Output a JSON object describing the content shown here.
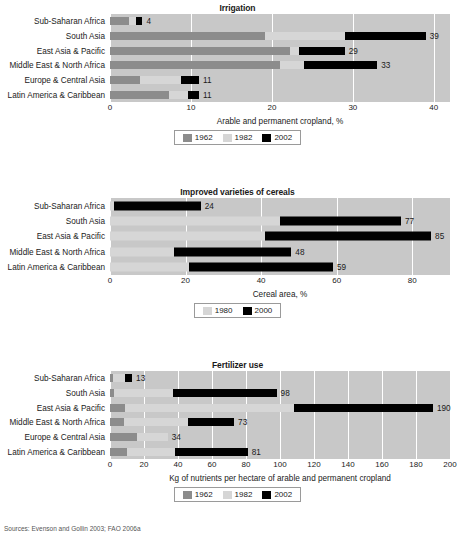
{
  "figure": {
    "source_note": "Sources: Evenson and Gollin 2003; FAO 2006a"
  },
  "colors": {
    "c1962": "#8c8c8c",
    "c1982": "#d6d6d6",
    "c2002": "#000000",
    "c1980": "#d6d6d6",
    "c2000": "#000000",
    "plot_background": "#c8c8c8",
    "gridline": "#ffffff"
  },
  "chart_data": [
    {
      "type": "bar",
      "orientation": "horizontal",
      "title": "Irrigation",
      "xlabel": "Arable and permanent cropland, %",
      "ylabel": "",
      "xlim": [
        0,
        42
      ],
      "xticks": [
        0,
        10,
        20,
        30,
        40
      ],
      "xticklabels": [
        "0",
        "10",
        "20",
        "30",
        "40"
      ],
      "grid": true,
      "legend_position": "bottom",
      "categories": [
        "Sub-Saharan Africa",
        "South Asia",
        "East Asia & Pacific",
        "Middle East & North Africa",
        "Europe & Central Asia",
        "Latin America & Caribbean"
      ],
      "series": [
        {
          "name": "1962",
          "values": [
            2.3,
            19.2,
            22.2,
            21.0,
            3.7,
            7.3
          ]
        },
        {
          "name": "1982",
          "values": [
            3.2,
            29.0,
            23.3,
            24.0,
            8.8,
            9.6
          ]
        },
        {
          "name": "2002",
          "values": [
            4,
            39,
            29,
            33,
            11,
            11
          ]
        }
      ],
      "data_labels": [
        "4",
        "39",
        "29",
        "33",
        "11",
        "11"
      ]
    },
    {
      "type": "bar",
      "orientation": "horizontal",
      "title": "Improved varieties of cereals",
      "xlabel": "Cereal area, %",
      "ylabel": "",
      "xlim": [
        0,
        90
      ],
      "xticks": [
        0,
        20,
        40,
        60,
        80
      ],
      "xticklabels": [
        "0",
        "20",
        "40",
        "60",
        "80"
      ],
      "grid": true,
      "legend_position": "bottom",
      "categories": [
        "Sub-Saharan Africa",
        "South Asia",
        "East Asia & Pacific",
        "Middle East & North Africa",
        "Latin America & Caribbean"
      ],
      "series": [
        {
          "name": "1980",
          "values": [
            1,
            45,
            41,
            17,
            21
          ]
        },
        {
          "name": "2000",
          "values": [
            24,
            77,
            85,
            48,
            59
          ]
        }
      ],
      "data_labels": [
        "24",
        "77",
        "85",
        "48",
        "59"
      ]
    },
    {
      "type": "bar",
      "orientation": "horizontal",
      "title": "Fertilizer use",
      "xlabel": "Kg of nutrients per hectare of arable and permanent cropland",
      "ylabel": "",
      "xlim": [
        0,
        200
      ],
      "xticks": [
        0,
        20,
        40,
        60,
        80,
        100,
        120,
        140,
        160,
        180,
        200
      ],
      "xticklabels": [
        "0",
        "20",
        "40",
        "60",
        "80",
        "100",
        "120",
        "140",
        "160",
        "180",
        "200"
      ],
      "grid": true,
      "legend_position": "bottom",
      "categories": [
        "Sub-Saharan Africa",
        "South Asia",
        "East Asia & Pacific",
        "Middle East & North Africa",
        "Europe & Central Asia",
        "Latin America & Caribbean"
      ],
      "series": [
        {
          "name": "1962",
          "values": [
            1.5,
            2.5,
            9,
            8,
            16,
            10
          ]
        },
        {
          "name": "1982",
          "values": [
            9,
            37,
            108,
            46,
            34,
            38
          ]
        },
        {
          "name": "2002",
          "values": [
            13,
            98,
            190,
            73,
            34,
            81
          ]
        }
      ],
      "data_labels": [
        "13",
        "98",
        "190",
        "73",
        "34",
        "81"
      ]
    }
  ]
}
